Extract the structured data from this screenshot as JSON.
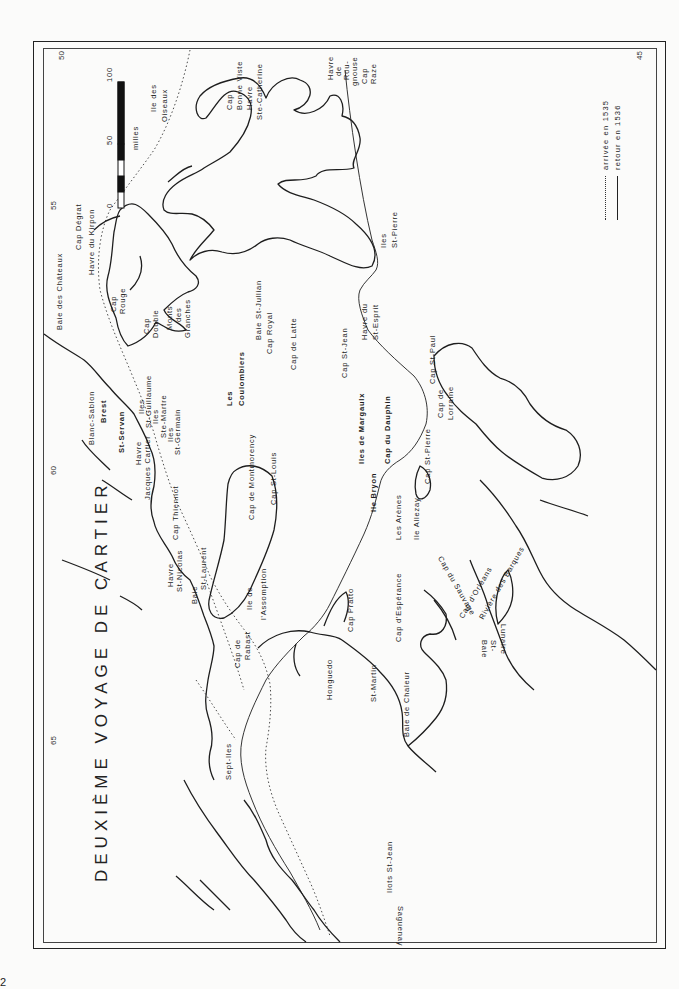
{
  "title": "DEUXIÈME VOYAGE DE CARTIER",
  "page_number": "2",
  "longitude_ticks": [
    {
      "label": "50",
      "x": 57,
      "y": 56
    },
    {
      "label": "55",
      "x": 49,
      "y": 205
    },
    {
      "label": "60",
      "x": 49,
      "y": 469
    },
    {
      "label": "65",
      "x": 49,
      "y": 740
    },
    {
      "label": "45",
      "x": 640,
      "y": 60
    }
  ],
  "scale_bar": {
    "unit": "milles",
    "marks": [
      "0",
      "50",
      "100"
    ]
  },
  "legend": {
    "items": [
      {
        "symbol": "dotted",
        "label": "arrivée en 1535"
      },
      {
        "symbol": "solid",
        "label": "retour en 1536"
      }
    ]
  },
  "places": {
    "ile_des_oiseaux": [
      "Ile des",
      "Oiseaux"
    ],
    "cap_bonne_viste": [
      "Cap",
      "Bonne Viste"
    ],
    "havre_ste_catherine": [
      "Havre",
      "Ste-Catherine"
    ],
    "havre_de_rougenouse": [
      "Havre",
      "de",
      "Rou-",
      "gnouse"
    ],
    "cap_raze": [
      "Cap",
      "Raze"
    ],
    "cap_degrat": "Cap Dégrat",
    "havre_du_kirpon": "Havre du Kirpon",
    "baie_des_chateaux": "Baie des Châteaux",
    "cap_rouge": [
      "Cap",
      "Rouge"
    ],
    "cap_double": [
      "Cap",
      "Double"
    ],
    "monts_des_granches": [
      "Monts",
      "des",
      "Granches"
    ],
    "baie_st_jullian": "Baie  St-Jullian",
    "cap_royal": "Cap  Royal",
    "cap_de_latte": "Cap de Latte",
    "les_coulombiers": [
      "Les",
      "Coulombiers"
    ],
    "blanc_sablon": "Blanc-Sablon",
    "brest": "Brest",
    "st_servan": "St-Servan",
    "iles_st_guillaume": [
      "Iles",
      "St-Guillaume"
    ],
    "iles_ste_martre": [
      "Iles",
      "Ste-Martre"
    ],
    "iles_st_germain": [
      "Iles",
      "St-Germain"
    ],
    "havre_jacques_cartier": [
      "Havre",
      "Jacques Cartier"
    ],
    "cap_thiennot": "Cap Thiennot",
    "havre_st_nicolas": [
      "Havre",
      "St-Nicolas"
    ],
    "baie_st_laurent": [
      "Baie",
      "St-Laurent"
    ],
    "cap_de_montmorency": "Cap de Montmorency",
    "cap_st_louis": "Cap  St-Louis",
    "ile_de_lassomption": [
      "Ile  de",
      "l'Assomption"
    ],
    "cap_de_rabast": [
      "Cap  de",
      "Rabast"
    ],
    "cap_st_jean": "Cap St-Jean",
    "havre_du_st_esprit": [
      "Havre du",
      "St-Esprit"
    ],
    "iles_st_pierre": [
      "Iles",
      "St-Pierre"
    ],
    "cap_st_paul": "Cap St-Paul",
    "cap_de_lorraine": [
      "Cap de",
      "Lorraine"
    ],
    "iles_de_margaulx": "Iles de Margaulx",
    "cap_du_dauphin": "Cap du Dauphin",
    "ile_bryon": "Ile Bryon",
    "les_arenes": "Les Arènes",
    "ile_allezay": "Ile  Allezay",
    "cap_st_pierre": "Cap St-Pierre",
    "cap_du_sauvage": "Cap du Sauvage",
    "cap_dorleans": "Cap d'Orléans",
    "riviere_des_barques": "Rivière des Barques",
    "baie_st_lunaire": [
      "Baie",
      "St-",
      "Lunaire"
    ],
    "cap_pratto": "Cap Pratto",
    "cap_desperance": "Cap d'Espérance",
    "honguedo": "Honguedo",
    "st_martin": "St-Martin",
    "baie_de_chaleur": "Baie de Chaleur",
    "sept_iles": "Sept-Iles",
    "ilots_st_jean": "Ilots St-Jean",
    "saguenay": "Saguenay"
  }
}
